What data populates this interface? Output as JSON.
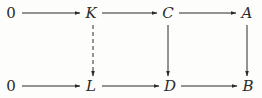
{
  "diagram": {
    "kind": "commutative-diagram",
    "colors": {
      "ink": "#2b2a28",
      "background": "#fdfdfb"
    },
    "nodes": [
      {
        "id": "zero-top",
        "label": "0",
        "row": "top"
      },
      {
        "id": "K",
        "label": "K",
        "row": "top"
      },
      {
        "id": "C",
        "label": "C",
        "row": "top"
      },
      {
        "id": "A",
        "label": "A",
        "row": "top"
      },
      {
        "id": "zero-bottom",
        "label": "0",
        "row": "bottom"
      },
      {
        "id": "L",
        "label": "L",
        "row": "bottom"
      },
      {
        "id": "D",
        "label": "D",
        "row": "bottom"
      },
      {
        "id": "B",
        "label": "B",
        "row": "bottom"
      }
    ],
    "edges": [
      {
        "from": "zero-top",
        "to": "K",
        "style": "solid"
      },
      {
        "from": "K",
        "to": "C",
        "style": "solid"
      },
      {
        "from": "C",
        "to": "A",
        "style": "solid"
      },
      {
        "from": "zero-bottom",
        "to": "L",
        "style": "solid"
      },
      {
        "from": "L",
        "to": "D",
        "style": "solid"
      },
      {
        "from": "D",
        "to": "B",
        "style": "solid"
      },
      {
        "from": "K",
        "to": "L",
        "style": "dashed"
      },
      {
        "from": "C",
        "to": "D",
        "style": "solid"
      },
      {
        "from": "A",
        "to": "B",
        "style": "solid"
      }
    ]
  }
}
